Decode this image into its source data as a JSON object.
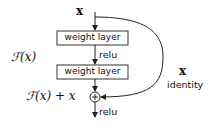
{
  "diagram": {
    "input_label": "x",
    "layers": [
      {
        "label": "weight layer"
      },
      {
        "label": "weight layer"
      }
    ],
    "activations": [
      {
        "label": "relu"
      },
      {
        "label": "relu"
      }
    ],
    "residual_function_label": "ℱ(x)",
    "sum_label": "ℱ(x) + x",
    "sum_symbol": "+",
    "shortcut": {
      "value_label": "x",
      "type_label": "identity"
    },
    "colors": {
      "line": "#222222",
      "box_border": "#333333",
      "background": "#ffffff"
    }
  }
}
